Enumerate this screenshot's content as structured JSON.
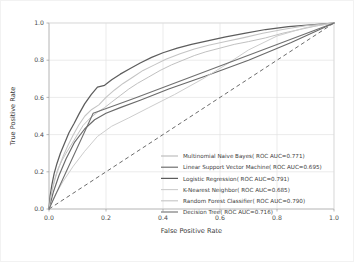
{
  "chart_data": {
    "type": "line",
    "title": "",
    "xlabel": "False Positive Rate",
    "ylabel": "True Positive Rate",
    "xlim": [
      0.0,
      1.0
    ],
    "ylim": [
      0.0,
      1.0
    ],
    "grid": true,
    "legend_position": "lower right",
    "xticks": [
      "0.0",
      "0.2",
      "0.4",
      "0.6",
      "0.8",
      "1.0"
    ],
    "yticks": [
      "0.0",
      "0.2",
      "0.4",
      "0.6",
      "0.8",
      "1.0"
    ],
    "xtick_values": [
      0.0,
      0.2,
      0.4,
      0.6,
      0.8,
      1.0
    ],
    "ytick_values": [
      0.0,
      0.2,
      0.4,
      0.6,
      0.8,
      1.0
    ],
    "series": [
      {
        "name": "Multinomial Naive Bayes",
        "legend_label": "Multinomial Naive Bayes( ROC AUC=0.771)",
        "auc": 0.771,
        "color": "#b9b9b9",
        "linewidth": 0.9,
        "dash": "",
        "x": [
          0.0,
          0.005,
          0.012,
          0.02,
          0.03,
          0.045,
          0.06,
          0.08,
          0.1,
          0.12,
          0.145,
          0.17,
          0.195,
          0.22,
          0.25,
          0.28,
          0.31,
          0.35,
          0.39,
          0.43,
          0.47,
          0.51,
          0.55,
          0.6,
          0.65,
          0.7,
          0.76,
          0.82,
          0.88,
          0.94,
          1.0
        ],
        "y": [
          0.0,
          0.06,
          0.11,
          0.16,
          0.21,
          0.26,
          0.3,
          0.35,
          0.4,
          0.45,
          0.49,
          0.52,
          0.545,
          0.575,
          0.61,
          0.645,
          0.675,
          0.71,
          0.745,
          0.775,
          0.8,
          0.825,
          0.845,
          0.865,
          0.885,
          0.9,
          0.92,
          0.945,
          0.965,
          0.985,
          1.0
        ]
      },
      {
        "name": "Linear Support Vector Machine",
        "legend_label": "Linear Support Vector Machine( ROC AUC=0.695)",
        "auc": 0.695,
        "color": "#6a6a6a",
        "linewidth": 1.15,
        "dash": "",
        "x": [
          0.0,
          0.015,
          0.035,
          0.06,
          0.09,
          0.125,
          0.16,
          0.2,
          0.25,
          0.32,
          0.42,
          0.55,
          0.7,
          0.85,
          1.0
        ],
        "y": [
          0.0,
          0.09,
          0.18,
          0.27,
          0.36,
          0.43,
          0.48,
          0.515,
          0.545,
          0.585,
          0.645,
          0.715,
          0.8,
          0.895,
          1.0
        ]
      },
      {
        "name": "Logistic Regression",
        "legend_label": "Logistic Regression( ROC AUC=0.791)",
        "auc": 0.791,
        "color": "#5d5d5d",
        "linewidth": 1.25,
        "dash": "",
        "x": [
          0.0,
          0.004,
          0.01,
          0.018,
          0.028,
          0.04,
          0.055,
          0.07,
          0.088,
          0.105,
          0.125,
          0.148,
          0.17,
          0.195,
          0.22,
          0.25,
          0.285,
          0.32,
          0.36,
          0.4,
          0.45,
          0.5,
          0.56,
          0.62,
          0.69,
          0.76,
          0.84,
          0.92,
          1.0
        ],
        "y": [
          0.0,
          0.07,
          0.13,
          0.19,
          0.245,
          0.3,
          0.355,
          0.41,
          0.46,
          0.51,
          0.565,
          0.615,
          0.655,
          0.665,
          0.695,
          0.725,
          0.755,
          0.785,
          0.815,
          0.84,
          0.865,
          0.885,
          0.905,
          0.925,
          0.945,
          0.965,
          0.98,
          0.99,
          1.0
        ]
      },
      {
        "name": "K-Nearest Neighbor",
        "legend_label": "K-Nearest Neighbor( ROC AUC=0.685)",
        "auc": 0.685,
        "color": "#cdcdcd",
        "linewidth": 1.0,
        "dash": "",
        "x": [
          0.0,
          0.02,
          0.05,
          0.085,
          0.125,
          0.17,
          0.22,
          0.28,
          0.35,
          0.44,
          0.54,
          0.62,
          0.7,
          0.8,
          0.9,
          1.0
        ],
        "y": [
          0.0,
          0.07,
          0.15,
          0.23,
          0.31,
          0.39,
          0.445,
          0.49,
          0.545,
          0.615,
          0.7,
          0.775,
          0.855,
          0.93,
          0.975,
          1.0
        ]
      },
      {
        "name": "Random Forest Classifier",
        "legend_label": "Random Forest Classifier( ROC AUC=0.790)",
        "auc": 0.79,
        "color": "#c4c4c4",
        "linewidth": 1.05,
        "dash": "",
        "x": [
          0.0,
          0.006,
          0.014,
          0.024,
          0.036,
          0.05,
          0.066,
          0.084,
          0.104,
          0.126,
          0.15,
          0.175,
          0.2,
          0.23,
          0.26,
          0.295,
          0.33,
          0.37,
          0.41,
          0.46,
          0.51,
          0.56,
          0.62,
          0.68,
          0.75,
          0.82,
          0.9,
          1.0
        ],
        "y": [
          0.0,
          0.065,
          0.12,
          0.175,
          0.23,
          0.285,
          0.34,
          0.395,
          0.45,
          0.5,
          0.535,
          0.56,
          0.6,
          0.64,
          0.675,
          0.71,
          0.745,
          0.775,
          0.805,
          0.835,
          0.86,
          0.88,
          0.9,
          0.92,
          0.945,
          0.965,
          0.985,
          1.0
        ]
      },
      {
        "name": "Decision Tree",
        "legend_label": "Decision Tree( ROC AUC=0.716)",
        "auc": 0.716,
        "color": "#707070",
        "linewidth": 1.1,
        "dash": "",
        "x": [
          0.0,
          0.155,
          0.3,
          1.0
        ],
        "y": [
          0.0,
          0.515,
          0.595,
          1.0
        ]
      }
    ],
    "reference_line": {
      "name": "chance-diagonal",
      "color": "#5a5a5a",
      "dash": "4 3",
      "linewidth": 0.9,
      "x": [
        0.0,
        1.0
      ],
      "y": [
        0.0,
        1.0
      ]
    }
  }
}
